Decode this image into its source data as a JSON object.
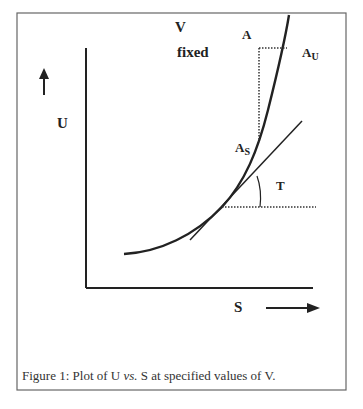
{
  "figure": {
    "labels": {
      "v": "V",
      "fixed": "fixed",
      "a": "A",
      "au_main": "A",
      "au_sub": "U",
      "as_main": "A",
      "as_sub": "S",
      "t": "T",
      "u": "U",
      "s": "S"
    },
    "caption": {
      "prefix": "Figure 1: Plot of U ",
      "italic": "vs.",
      "suffix": " S at specified values of V."
    }
  },
  "colors": {
    "line": "#222222",
    "frame": "#555555",
    "text": "#222222"
  }
}
